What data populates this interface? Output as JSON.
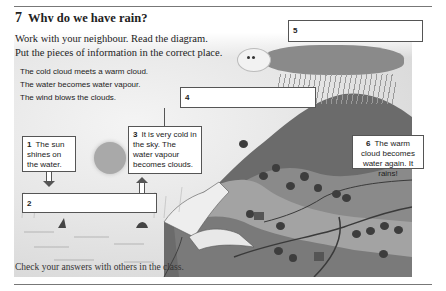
{
  "exercise": {
    "number": "7",
    "title": "Why do we have rain?",
    "instructions": [
      "Work with your neighbour.  Read the diagram.",
      "Put the pieces of information in the correct place."
    ],
    "pieces": [
      "The cold cloud meets a warm cloud.",
      "The water becomes water vapour.",
      "The wind blows the clouds."
    ],
    "boxes": [
      {
        "number": "1",
        "text": "The sun shines on the water."
      },
      {
        "number": "2",
        "text": ""
      },
      {
        "number": "3",
        "text": "It is very cold in the sky. The water vapour becomes clouds."
      },
      {
        "number": "4",
        "text": ""
      },
      {
        "number": "5",
        "text": ""
      },
      {
        "number": "6",
        "text": "The warm cloud becomes water again. It rains!"
      }
    ],
    "footer": "Check your answers with others in the class."
  },
  "colors": {
    "rule": "#777777",
    "box_border": "#555555",
    "text": "#222222"
  }
}
